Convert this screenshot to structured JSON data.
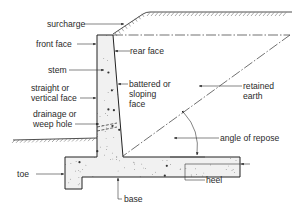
{
  "diagram": {
    "labels": {
      "surcharge": "surcharge",
      "front_face": "front face",
      "rear_face": "rear face",
      "stem": "stem",
      "straight_face_1": "straight or",
      "straight_face_2": "vertical face",
      "battered_1": "battered or",
      "battered_2": "sloping",
      "battered_3": "face",
      "drainage_1": "drainage or",
      "drainage_2": "weep hole",
      "retained_1": "retained",
      "retained_2": "earth",
      "angle": "angle of repose",
      "toe": "toe",
      "base": "base",
      "heel": "heel"
    },
    "colors": {
      "line": "#222222",
      "concrete_fill": "#f1f1f1",
      "text": "#2a2a2a"
    }
  }
}
